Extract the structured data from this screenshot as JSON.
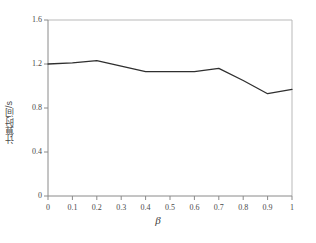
{
  "figure": {
    "background_color": "#ffffff",
    "line_color": "#2f2f2f",
    "axis_color": "#8a8a8a"
  },
  "chart_data": {
    "type": "line",
    "title": "",
    "xlabel": "β",
    "ylabel": "计算时间/s",
    "x": [
      0,
      0.1,
      0.2,
      0.3,
      0.4,
      0.5,
      0.6,
      0.7,
      0.8,
      0.9,
      1
    ],
    "values": [
      1.2,
      1.21,
      1.23,
      1.18,
      1.13,
      1.13,
      1.13,
      1.16,
      1.05,
      0.93,
      0.97
    ],
    "series": [
      {
        "name": "计算时间",
        "values": [
          1.2,
          1.21,
          1.23,
          1.18,
          1.13,
          1.13,
          1.13,
          1.16,
          1.05,
          0.93,
          0.97
        ]
      }
    ],
    "xlim": [
      0,
      1
    ],
    "ylim": [
      0,
      1.6
    ],
    "xticks": [
      0,
      0.1,
      0.2,
      0.3,
      0.4,
      0.5,
      0.6,
      0.7,
      0.8,
      0.9,
      1
    ],
    "xtick_labels": [
      "0",
      "0.1",
      "0.2",
      "0.3",
      "0.4",
      "0.5",
      "0.6",
      "0.7",
      "0.8",
      "0.9",
      "1"
    ],
    "yticks": [
      0,
      0.4,
      0.8,
      1.2,
      1.6
    ],
    "ytick_labels": [
      "0",
      "0.4",
      "0.8",
      "1.2",
      "1.6"
    ],
    "grid": false,
    "legend": null,
    "legend_position": "none",
    "annotations": []
  }
}
